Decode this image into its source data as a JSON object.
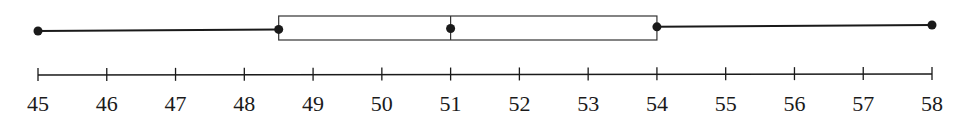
{
  "chart_data": {
    "type": "boxplot",
    "title": "",
    "xlabel": "",
    "ylabel": "",
    "xlim": [
      45,
      58
    ],
    "grid": false,
    "legend": null,
    "five_number_summary": {
      "min": 45,
      "q1": 48.5,
      "median": 51,
      "q3": 54,
      "max": 58
    },
    "ticks": [
      45,
      46,
      47,
      48,
      49,
      50,
      51,
      52,
      53,
      54,
      55,
      56,
      57,
      58
    ],
    "tick_labels": [
      "45",
      "46",
      "47",
      "48",
      "49",
      "50",
      "51",
      "52",
      "53",
      "54",
      "55",
      "56",
      "57",
      "58"
    ]
  },
  "colors": {
    "line": "#1a1a1a",
    "box_stroke": "#333333",
    "background": "#ffffff"
  }
}
